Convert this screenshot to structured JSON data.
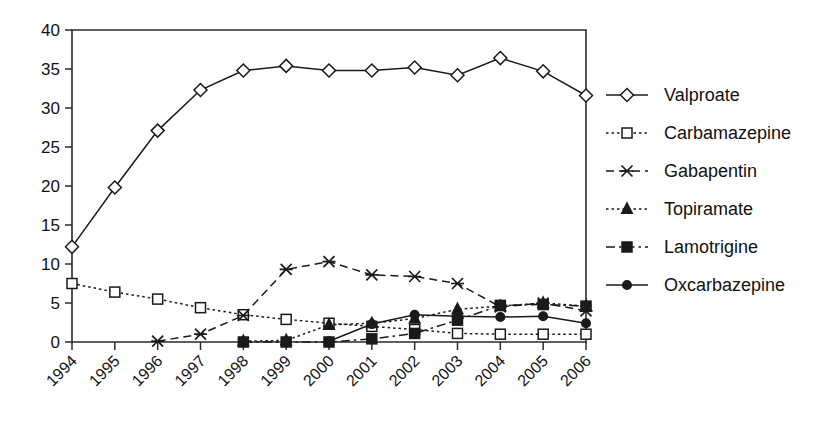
{
  "chart_data": {
    "type": "line",
    "title": "",
    "xlabel": "",
    "ylabel": "",
    "x": [
      "1994",
      "1995",
      "1996",
      "1997",
      "1998",
      "1999",
      "2000",
      "2001",
      "2002",
      "2003",
      "2004",
      "2005",
      "2006"
    ],
    "categories": [
      "1994",
      "1995",
      "1996",
      "1997",
      "1998",
      "1999",
      "2000",
      "2001",
      "2002",
      "2003",
      "2004",
      "2005",
      "2006"
    ],
    "ylim": [
      0,
      40
    ],
    "yticks": [
      0,
      5,
      10,
      15,
      20,
      25,
      30,
      35,
      40
    ],
    "ytick_labels": [
      "0",
      "5",
      "10",
      "15",
      "20",
      "25",
      "30",
      "35",
      "40"
    ],
    "grid": false,
    "legend_position": "right",
    "xtick_rotation": -45,
    "series": [
      {
        "name": "Valproate",
        "marker": "open-diamond",
        "line_style": "solid",
        "values": [
          12.2,
          19.8,
          27.1,
          32.3,
          34.8,
          35.4,
          34.8,
          34.8,
          35.2,
          34.2,
          36.4,
          34.7,
          31.6
        ]
      },
      {
        "name": "Carbamazepine",
        "marker": "open-square",
        "line_style": "dotted",
        "values": [
          7.5,
          6.4,
          5.5,
          4.4,
          3.5,
          2.9,
          2.4,
          2.0,
          1.6,
          1.1,
          1.0,
          1.0,
          1.0
        ]
      },
      {
        "name": "Gabapentin",
        "marker": "cross",
        "line_style": "dashed",
        "values": [
          null,
          null,
          0.1,
          1.0,
          3.4,
          9.3,
          10.3,
          8.6,
          8.4,
          7.5,
          4.5,
          5.0,
          4.0
        ]
      },
      {
        "name": "Topiramate",
        "marker": "solid-triangle",
        "line_style": "dotted",
        "values": [
          null,
          null,
          null,
          null,
          0.1,
          0.2,
          2.2,
          2.4,
          3.0,
          4.2,
          4.6,
          5.0,
          4.6
        ]
      },
      {
        "name": "Lamotrigine",
        "marker": "solid-square",
        "line_style": "dash-dot",
        "values": [
          null,
          null,
          null,
          null,
          0.0,
          0.0,
          0.0,
          0.4,
          1.1,
          2.8,
          4.7,
          4.8,
          4.6
        ]
      },
      {
        "name": "Oxcarbazepine",
        "marker": "solid-circle",
        "line_style": "solid",
        "values": [
          null,
          null,
          null,
          null,
          null,
          null,
          0.1,
          2.3,
          3.5,
          3.3,
          3.2,
          3.3,
          2.4
        ]
      }
    ]
  },
  "legend": {
    "items": [
      {
        "label": "Valproate"
      },
      {
        "label": "Carbamazepine"
      },
      {
        "label": "Gabapentin"
      },
      {
        "label": "Topiramate"
      },
      {
        "label": "Lamotrigine"
      },
      {
        "label": "Oxcarbazepine"
      }
    ]
  },
  "colors": {
    "ink": "#1a1a1a",
    "axis": "#2b2b2b",
    "background": "#ffffff"
  }
}
